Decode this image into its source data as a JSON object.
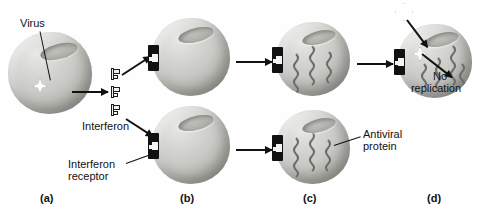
{
  "figure": {
    "background_color": "#fefefe",
    "ink_color": "#111111"
  },
  "labels": {
    "virus": "Virus",
    "interferon": "Interferon",
    "interferon_receptor_line1": "Interferon",
    "interferon_receptor_line2": "receptor",
    "antiviral_protein_line1": "Antiviral",
    "antiviral_protein_line2": "protein",
    "no_replication_line1": "No",
    "no_replication_line2": "replication"
  },
  "panels": [
    {
      "id": "a",
      "label": "(a)",
      "caption": "Virus-infected cell releases interferon"
    },
    {
      "id": "b",
      "label": "(b)",
      "caption": "Interferon binds to interferon receptors on neighboring cells"
    },
    {
      "id": "c",
      "label": "(c)",
      "caption": "Neighboring cells produce antiviral proteins"
    },
    {
      "id": "d",
      "label": "(d)",
      "caption": "New virus cannot replicate in the protected cell"
    }
  ],
  "icons": {
    "virus_particle": "virus-star-icon",
    "interferon_molecule": "interferon-molecule-icon",
    "receptor": "interferon-receptor-icon",
    "antiviral_protein": "antiviral-protein-squiggle-icon",
    "arrow": "right-arrow-icon"
  },
  "counts": {
    "interferon_molecules": 3,
    "cells_total": 6,
    "antiviral_proteins_panel_c_top": 3,
    "antiviral_proteins_panel_c_bottom": 3,
    "antiviral_proteins_panel_d": 4
  },
  "colors": {
    "cell_fill": "#c9c9c5",
    "cell_shadow": "#8d8d88",
    "receptor_fill": "#111111",
    "molecule_fill": "#f2f2f2",
    "stroke": "#1c1c1c"
  }
}
